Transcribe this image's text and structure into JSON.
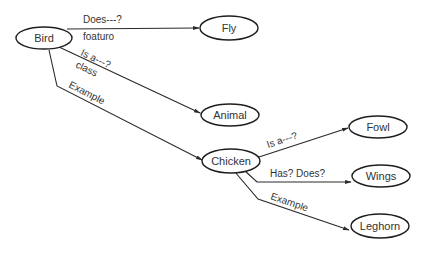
{
  "diagram": {
    "type": "semantic-network",
    "nodes": [
      {
        "id": "bird",
        "label": "Bird"
      },
      {
        "id": "fly",
        "label": "Fly"
      },
      {
        "id": "animal",
        "label": "Animal"
      },
      {
        "id": "chicken",
        "label": "Chicken"
      },
      {
        "id": "fowl",
        "label": "Fowl"
      },
      {
        "id": "wings",
        "label": "Wings"
      },
      {
        "id": "leghorn",
        "label": "Leghorn"
      }
    ],
    "edges": [
      {
        "id": "bird-fly",
        "from": "bird",
        "to": "fly",
        "label_above": "Does---?",
        "label_below": "foaturo"
      },
      {
        "id": "bird-animal",
        "from": "bird",
        "to": "animal",
        "label_above": "Is a---?",
        "label_below": "class"
      },
      {
        "id": "bird-chicken",
        "from": "bird",
        "to": "chicken",
        "label_above": "Example"
      },
      {
        "id": "chicken-fowl",
        "from": "chicken",
        "to": "fowl",
        "label_above": "Is a---?"
      },
      {
        "id": "chicken-wings",
        "from": "chicken",
        "to": "wings",
        "label_above": "Has? Does?"
      },
      {
        "id": "chicken-leghorn",
        "from": "chicken",
        "to": "leghorn",
        "label_above": "Example"
      }
    ]
  }
}
